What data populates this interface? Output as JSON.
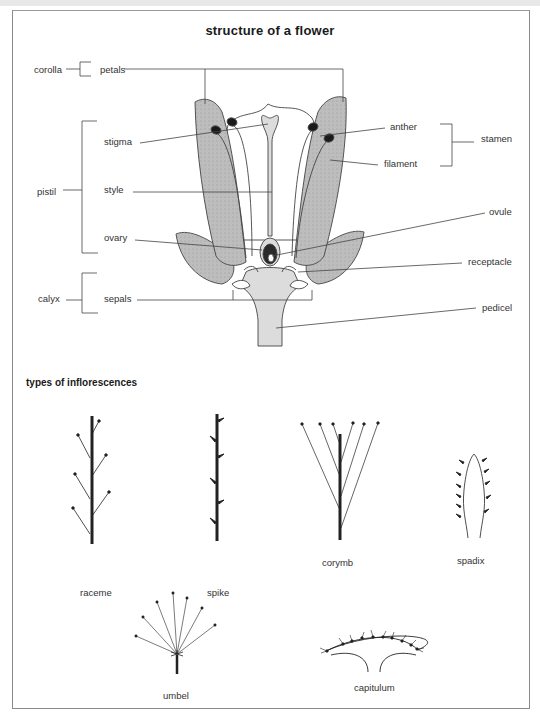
{
  "title": "structure of a flower",
  "flower_structure": {
    "groups": {
      "corolla": "corolla",
      "pistil": "pistil",
      "calyx": "calyx",
      "stamen": "stamen"
    },
    "parts": {
      "petals": "petals",
      "stigma": "stigma",
      "style": "style",
      "ovary": "ovary",
      "sepals": "sepals",
      "anther": "anther",
      "filament": "filament",
      "ovule": "ovule",
      "receptacle": "receptacle",
      "pedicel": "pedicel"
    }
  },
  "inflorescences": {
    "heading": "types of inflorescences",
    "types": {
      "raceme": "raceme",
      "spike": "spike",
      "corymb": "corymb",
      "spadix": "spadix",
      "umbel": "umbel",
      "capitulum": "capitulum"
    }
  },
  "colors": {
    "petal_fill": "#b8b8b8",
    "stem_fill": "#dcdcdc",
    "line": "#333333",
    "anther": "#1a1a1a"
  }
}
